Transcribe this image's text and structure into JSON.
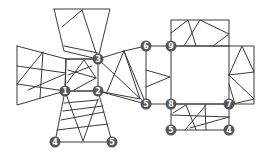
{
  "diagram": {
    "title": "",
    "colors": {
      "line": "#3a3a3a",
      "marker_fill": "#555555",
      "marker_text": "#ffffff",
      "background": "#ffffff"
    },
    "left_net": {
      "markers": [
        {
          "id": "m1",
          "label": "1",
          "x": 65,
          "y": 91
        },
        {
          "id": "m2",
          "label": "2",
          "x": 98,
          "y": 91
        },
        {
          "id": "m3",
          "label": "3",
          "x": 98,
          "y": 59
        },
        {
          "id": "m4",
          "label": "4",
          "x": 55,
          "y": 142
        },
        {
          "id": "m5",
          "label": "5",
          "x": 112,
          "y": 142
        }
      ]
    },
    "right_net": {
      "markers": [
        {
          "id": "m6",
          "label": "6",
          "x": 146,
          "y": 46
        },
        {
          "id": "m9",
          "label": "9",
          "x": 171,
          "y": 46
        },
        {
          "id": "m5b",
          "label": "5",
          "x": 146,
          "y": 104
        },
        {
          "id": "m8",
          "label": "8",
          "x": 171,
          "y": 104
        },
        {
          "id": "m7",
          "label": "7",
          "x": 229,
          "y": 104
        },
        {
          "id": "m5c",
          "label": "5",
          "x": 171,
          "y": 130
        },
        {
          "id": "m4b",
          "label": "4",
          "x": 229,
          "y": 130
        }
      ]
    }
  }
}
